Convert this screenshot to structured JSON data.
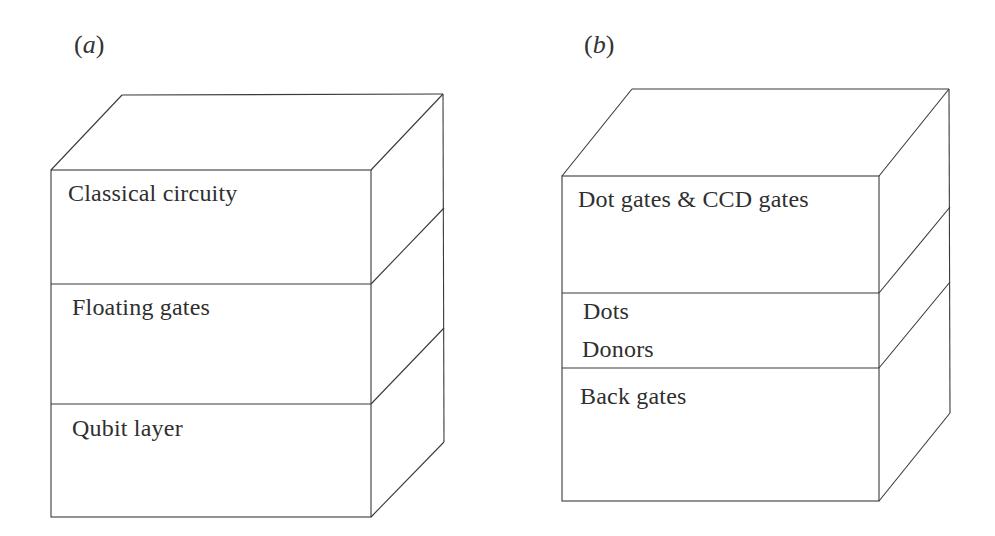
{
  "figure": {
    "panels": [
      {
        "id": "a",
        "label_open": "(",
        "label_letter": "a",
        "label_close": ")",
        "layers": [
          {
            "label": "Classical circuity"
          },
          {
            "label": "Floating gates"
          },
          {
            "label": "Qubit layer"
          }
        ]
      },
      {
        "id": "b",
        "label_open": "(",
        "label_letter": "b",
        "label_close": ")",
        "layers": [
          {
            "label": "Dot gates & CCD gates"
          },
          {
            "label_lines": [
              "Dots",
              "Donors"
            ]
          },
          {
            "label": "Back gates"
          }
        ]
      }
    ],
    "colors": {
      "line": "#3a3a3a",
      "text": "#2f2f2f",
      "background": "#ffffff"
    }
  }
}
